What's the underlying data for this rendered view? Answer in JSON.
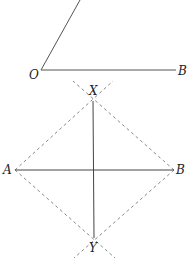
{
  "figure_top": {
    "label_vertex": "O",
    "label_ray_end": "B",
    "line_color": "#555555"
  },
  "figure_bottom": {
    "label_top": "X",
    "label_bottom": "Y",
    "label_left": "A",
    "label_right": "B",
    "line_color": "#444444",
    "dashed_color": "#888888"
  }
}
